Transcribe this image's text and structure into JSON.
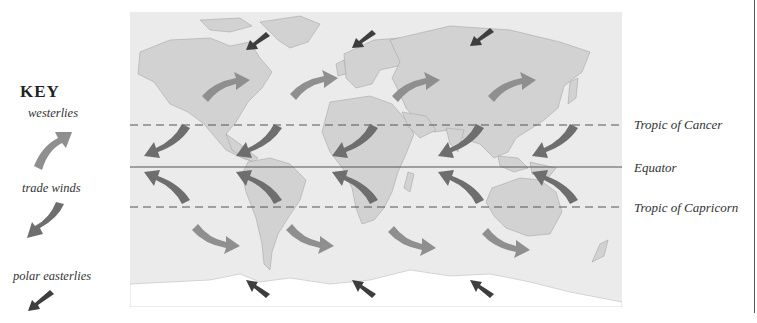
{
  "key": {
    "title": "KEY",
    "items": [
      {
        "label": "westerlies",
        "icon": "westerlies-arrow-icon",
        "color": "#8f8f8f"
      },
      {
        "label": "trade winds",
        "icon": "trade-winds-arrow-icon",
        "color": "#6e6e6e"
      },
      {
        "label": "polar easterlies",
        "icon": "polar-easterlies-arrow-icon",
        "color": "#3e3e3e"
      }
    ]
  },
  "latitude_lines": [
    {
      "label": "Tropic of Cancer",
      "style": "dashed"
    },
    {
      "label": "Equator",
      "style": "solid"
    },
    {
      "label": "Tropic of Capricorn",
      "style": "dashed"
    }
  ],
  "colors": {
    "ocean": "#ebebeb",
    "land": "#d2d2d2",
    "westerlies": "#8f8f8f",
    "trade_winds": "#6e6e6e",
    "polar_easterlies": "#3e3e3e",
    "line": "#555555"
  }
}
